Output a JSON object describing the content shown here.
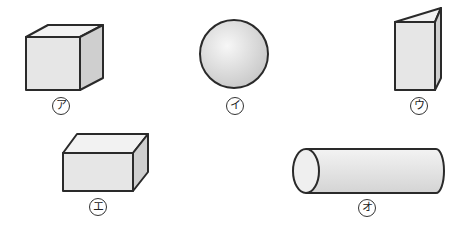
{
  "shapes": [
    {
      "id": "cube",
      "label": "ア"
    },
    {
      "id": "sphere",
      "label": "イ"
    },
    {
      "id": "triangular-prism",
      "label": "ウ"
    },
    {
      "id": "rectangular-prism",
      "label": "エ"
    },
    {
      "id": "cylinder",
      "label": "オ"
    }
  ],
  "colors": {
    "stroke": "#2a2a2a",
    "front": "#e6e6e6",
    "top": "#f2f2f2",
    "side": "#cfcfcf"
  }
}
